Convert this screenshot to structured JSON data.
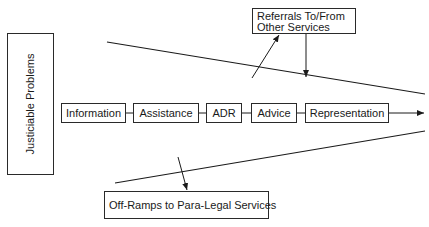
{
  "diagram": {
    "left_label": "Justiciable Problems",
    "steps": [
      {
        "label": "Information"
      },
      {
        "label": "Assistance"
      },
      {
        "label": "ADR"
      },
      {
        "label": "Advice"
      },
      {
        "label": "Representation"
      }
    ],
    "referrals_box": "Referrals To/From Other Services",
    "offramps_box": "Off-Ramps to Para-Legal Services",
    "colors": {
      "line": "#1a1a1a",
      "background": "#ffffff"
    }
  }
}
